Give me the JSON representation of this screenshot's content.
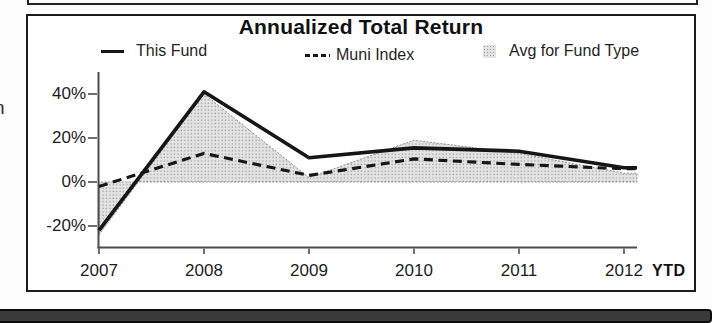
{
  "title": "Annualized Total Return",
  "legend": {
    "this_fund": "This Fund",
    "muni_index": "Muni Index",
    "avg_fund_type": "Avg for Fund Type"
  },
  "edge_fragments": {
    "left_upper": "n",
    "left_lower": "l"
  },
  "chart_data": {
    "type": "line",
    "title": "Annualized Total Return",
    "categories": [
      "2007",
      "2008",
      "2009",
      "2010",
      "2011",
      "2012"
    ],
    "x_axis_suffix": "YTD",
    "y_ticks": [
      "40%",
      "20%",
      "0%",
      "-20%"
    ],
    "y_tick_values": [
      40,
      20,
      0,
      -20
    ],
    "ylim": [
      -30,
      50
    ],
    "grid": false,
    "legend_position": "top",
    "xlabel": "",
    "ylabel": "",
    "series": [
      {
        "name": "This Fund",
        "style": "solid-line",
        "color": "#161616",
        "values": [
          -22,
          41,
          11,
          15.5,
          14,
          6.5
        ]
      },
      {
        "name": "Muni Index",
        "style": "dashed-line",
        "color": "#161616",
        "values": [
          -2,
          13,
          3,
          10.5,
          8,
          6
        ]
      },
      {
        "name": "Avg for Fund Type",
        "style": "area",
        "color": "#d9d9d9",
        "values": [
          -24,
          40,
          2,
          19,
          13,
          4
        ]
      }
    ]
  }
}
